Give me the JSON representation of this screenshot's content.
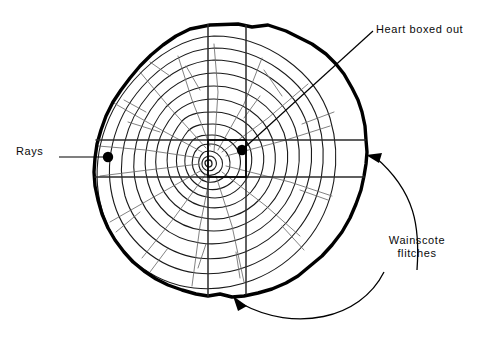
{
  "figure": {
    "background_color": "#ffffff",
    "ink_color": "#000000",
    "ring_color": "#1a1a1a",
    "ray_color": "#555555",
    "bark_color": "#000000"
  },
  "labels": {
    "heart": {
      "text": "Heart boxed out",
      "x": 376,
      "y": 23
    },
    "rays": {
      "text": "Rays",
      "x": 16,
      "y": 145
    },
    "wainscote": {
      "line1": "Wainscote",
      "line2": "flitches",
      "x": 371,
      "y": 234
    }
  },
  "annotations": {
    "heart_leader": {
      "name": "heart-leader-line",
      "from_x": 372,
      "from_y": 32,
      "to_x": 242,
      "to_y": 150,
      "marker": "filled-dot"
    },
    "rays_leader": {
      "name": "rays-leader-line",
      "from_x": 60,
      "from_y": 157,
      "to_x": 108,
      "to_y": 157,
      "marker": "filled-dot"
    },
    "wainscote_arrow_right": {
      "name": "wainscote-arrow-right",
      "tip_x": 368,
      "tip_y": 155,
      "marker": "arrowhead"
    },
    "wainscote_arrow_bottom": {
      "name": "wainscote-arrow-bottom",
      "tip_x": 235,
      "tip_y": 297,
      "marker": "arrowhead"
    },
    "dots": [
      {
        "name": "rays-dot",
        "x": 108,
        "y": 157,
        "r": 5
      },
      {
        "name": "heart-dot",
        "x": 242,
        "y": 150,
        "r": 5
      }
    ]
  },
  "geometry": {
    "center_x": 214,
    "center_y": 160,
    "saw_lines_vertical_x": [
      208,
      246
    ],
    "saw_lines_horizontal_y": [
      140,
      177
    ],
    "bark_bounds": {
      "left": 95,
      "top": 24,
      "right": 368,
      "bottom": 297
    },
    "growth_ring_count": 11
  }
}
